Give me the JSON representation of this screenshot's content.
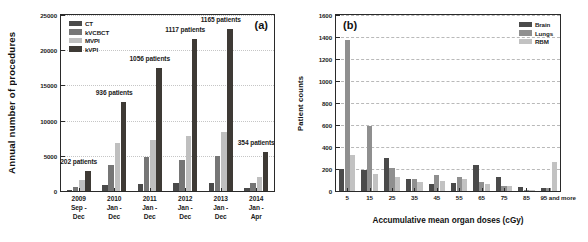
{
  "figure": {
    "panels": [
      {
        "tag": "(a)",
        "ylabel": "Annual number of procedures",
        "legend": [
          {
            "label": "CT",
            "color": "#4a4a4a",
            "key": "ct"
          },
          {
            "label": "kVCBCT",
            "color": "#767676",
            "key": "kvcbct"
          },
          {
            "label": "MVPI",
            "color": "#bfbfbf",
            "key": "mvpi"
          },
          {
            "label": "kVPI",
            "color": "#3e3a35",
            "key": "kvpi"
          }
        ]
      },
      {
        "tag": "(b)",
        "ylabel": "Patient counts",
        "xlabel": "Accumulative mean organ doses (cGy)",
        "legend": [
          {
            "label": "Brain",
            "color": "#4a4a4a",
            "key": "brain"
          },
          {
            "label": "Lungs",
            "color": "#8f8f8f",
            "key": "lungs"
          },
          {
            "label": "RBM",
            "color": "#c2c2c2",
            "key": "rbm"
          }
        ]
      }
    ]
  },
  "chart_data": [
    {
      "type": "bar",
      "panel": "(a)",
      "title": "",
      "xlabel": "",
      "ylabel": "Annual number of procedures",
      "ylim": [
        0,
        25000
      ],
      "yticks": [
        0,
        5000,
        10000,
        15000,
        20000,
        25000
      ],
      "grid": true,
      "legend_position": "top-left",
      "categories": [
        "2009",
        "2010",
        "2011",
        "2012",
        "2013",
        "2014"
      ],
      "category_sublabels": [
        "Sep - Dec",
        "Jan - Dec",
        "Jan - Dec",
        "Jan - Dec",
        "Jan - Dec",
        "Jan - Apr"
      ],
      "annotations": [
        "202 patients",
        "936 patients",
        "1056 patients",
        "1117 patients",
        "1165 patients",
        "354 patients"
      ],
      "series": [
        {
          "name": "CT",
          "values": [
            200,
            900,
            1050,
            1100,
            1180,
            400
          ]
        },
        {
          "name": "kVCBCT",
          "values": [
            550,
            3750,
            4800,
            4450,
            4950,
            1100
          ]
        },
        {
          "name": "MVPI",
          "values": [
            1550,
            6750,
            7250,
            7800,
            8350,
            2050
          ]
        },
        {
          "name": "kVPI",
          "values": [
            2850,
            12700,
            17500,
            21650,
            23050,
            5600
          ]
        }
      ]
    },
    {
      "type": "bar",
      "panel": "(b)",
      "title": "",
      "xlabel": "Accumulative mean organ doses (cGy)",
      "ylabel": "Patient counts",
      "ylim": [
        0,
        1600
      ],
      "yticks": [
        0,
        200,
        400,
        600,
        800,
        1000,
        1200,
        1400,
        1600
      ],
      "grid": true,
      "legend_position": "top-right",
      "categories": [
        "5",
        "15",
        "25",
        "35",
        "45",
        "55",
        "65",
        "75",
        "85",
        "95 and more"
      ],
      "series": [
        {
          "name": "Brain",
          "values": [
            200,
            195,
            300,
            110,
            60,
            70,
            235,
            125,
            35,
            25
          ]
        },
        {
          "name": "Lungs",
          "values": [
            1375,
            590,
            210,
            110,
            145,
            130,
            85,
            45,
            10,
            30
          ]
        },
        {
          "name": "RBM",
          "values": [
            330,
            155,
            125,
            85,
            95,
            105,
            65,
            45,
            8,
            260
          ]
        }
      ]
    }
  ]
}
